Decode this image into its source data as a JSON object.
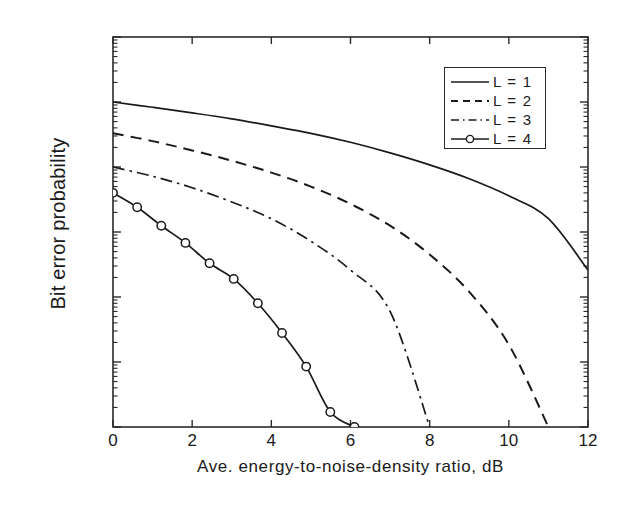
{
  "chart_data": {
    "type": "line",
    "title": "",
    "xlabel": "Ave. energy-to-noise-density ratio, dB",
    "ylabel": "Bit error probability",
    "xlim": [
      0,
      12
    ],
    "ylim": [
      1e-06,
      1
    ],
    "yscale": "log",
    "grid": false,
    "legend_position": "upper right",
    "xticks": [
      "0",
      "2",
      "4",
      "6",
      "8",
      "10",
      "12"
    ],
    "xtick_values": [
      0,
      2,
      4,
      6,
      8,
      10,
      12
    ],
    "yticks": [
      "10",
      "10",
      "10",
      "10",
      "10",
      "10",
      "10"
    ],
    "ytick_exponents": [
      "0",
      "-1",
      "-2",
      "-3",
      "-4",
      "-5",
      "-6"
    ],
    "ytick_values": [
      1,
      0.1,
      0.01,
      0.001,
      0.0001,
      1e-05,
      1e-06
    ],
    "series": [
      {
        "name": "L = 1",
        "style": "solid",
        "marker": "none",
        "color": "#1a1a1a",
        "x": [
          0,
          1,
          2,
          3,
          4,
          5,
          6,
          7,
          8,
          9,
          10,
          11,
          12
        ],
        "y": [
          0.1,
          0.083,
          0.068,
          0.055,
          0.043,
          0.033,
          0.024,
          0.0165,
          0.0108,
          0.0066,
          0.0036,
          0.0016,
          0.00026
        ]
      },
      {
        "name": "L = 2",
        "style": "dashed",
        "marker": "none",
        "color": "#1a1a1a",
        "x": [
          0,
          1,
          2,
          3,
          4,
          5,
          6,
          7,
          8,
          9,
          10,
          11
        ],
        "y": [
          0.033,
          0.025,
          0.018,
          0.0125,
          0.0082,
          0.005,
          0.0027,
          0.00125,
          0.00045,
          0.00012,
          1.85e-05,
          1e-06
        ]
      },
      {
        "name": "L = 3",
        "style": "dashdot",
        "marker": "none",
        "color": "#1a1a1a",
        "x": [
          0,
          1,
          2,
          3,
          4,
          5,
          6,
          7,
          8
        ],
        "y": [
          0.01,
          0.0072,
          0.0048,
          0.0029,
          0.0016,
          0.00072,
          0.00026,
          6e-05,
          1e-06
        ]
      },
      {
        "name": "L = 4",
        "style": "solid",
        "marker": "circle",
        "color": "#1a1a1a",
        "x": [
          0,
          0.61,
          1.22,
          1.83,
          2.44,
          3.05,
          3.66,
          4.27,
          4.88,
          5.49,
          6.1
        ],
        "y": [
          0.004,
          0.0024,
          0.00125,
          0.00068,
          0.00033,
          0.00019,
          8e-05,
          2.8e-05,
          8.5e-06,
          1.7e-06,
          1e-06
        ]
      }
    ],
    "legend_entries": [
      {
        "label": "L = 1",
        "style": "solid",
        "marker": "none"
      },
      {
        "label": "L = 2",
        "style": "dashed",
        "marker": "none"
      },
      {
        "label": "L = 3",
        "style": "dashdot",
        "marker": "none"
      },
      {
        "label": "L = 4",
        "style": "solid",
        "marker": "circle"
      }
    ]
  },
  "axis": {
    "frame_color": "#2a2a2a"
  }
}
